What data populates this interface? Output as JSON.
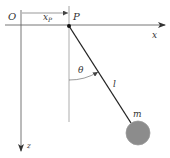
{
  "diagram": {
    "labels": {
      "origin": "O",
      "x_p_main": "x",
      "x_p_sub": "P",
      "pivot": "P",
      "x_axis": "x",
      "z_axis": "z",
      "angle": "θ",
      "length": "l",
      "mass": "m"
    },
    "colors": {
      "line": "#3a3a3a",
      "axis": "#555555",
      "bob_fill": "#8c8c8c",
      "bob_stroke": "#9a9a9a",
      "rod": "#222222",
      "background": "#ffffff"
    },
    "geometry": {
      "pivot": [
        69,
        26
      ],
      "bob_center": [
        138,
        133
      ],
      "bob_radius": 12,
      "x_axis_y": 25,
      "z_axis_x": 21
    }
  }
}
